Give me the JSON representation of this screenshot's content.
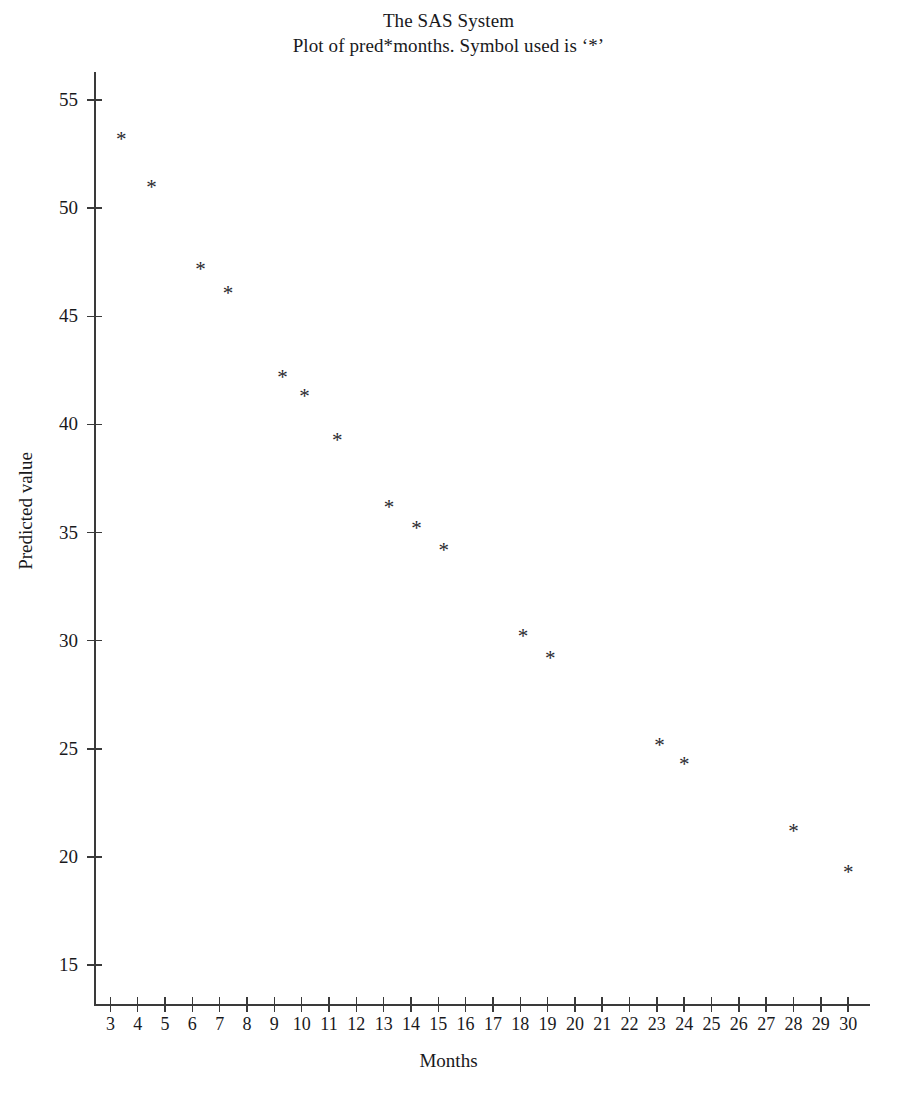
{
  "titles": {
    "line1": "The SAS System",
    "line2": "Plot of pred*months. Symbol used is ‘*’"
  },
  "axes": {
    "x_title": "Months",
    "y_title": "Predicted value"
  },
  "chart_data": {
    "type": "scatter",
    "title": "The SAS System",
    "subtitle": "Plot of pred*months. Symbol used is ‘*’",
    "xlabel": "Months",
    "ylabel": "Predicted value",
    "marker_symbol": "*",
    "marker_color": "#2a2a2e",
    "grid": false,
    "legend": "none",
    "xlim": [
      2.4,
      30.8
    ],
    "ylim": [
      13.2,
      56.3
    ],
    "x_ticks": [
      3,
      4,
      5,
      6,
      7,
      8,
      9,
      10,
      11,
      12,
      13,
      14,
      15,
      16,
      17,
      18,
      19,
      20,
      21,
      22,
      23,
      24,
      25,
      26,
      27,
      28,
      29,
      30
    ],
    "x_tick_labels": [
      "3",
      "4",
      "5",
      "6",
      "7",
      "8",
      "9",
      "10",
      "11",
      "12",
      "13",
      "14",
      "15",
      "16",
      "17",
      "18",
      "19",
      "20",
      "21",
      "22",
      "23",
      "24",
      "25",
      "26",
      "27",
      "28",
      "29",
      "30"
    ],
    "y_ticks": [
      15,
      20,
      25,
      30,
      35,
      40,
      45,
      50,
      55
    ],
    "y_tick_labels": [
      "15",
      "20",
      "25",
      "30",
      "35",
      "40",
      "45",
      "50",
      "55"
    ],
    "series": [
      {
        "name": "pred",
        "x": [
          3.4,
          4.5,
          6.3,
          7.3,
          9.3,
          10.1,
          11.3,
          13.2,
          14.2,
          15.2,
          18.1,
          19.1,
          23.1,
          24.0,
          28.0,
          30.0
        ],
        "y": [
          53.2,
          51.0,
          47.2,
          46.1,
          42.2,
          41.3,
          39.3,
          36.2,
          35.2,
          34.2,
          30.2,
          29.2,
          25.2,
          24.3,
          21.2,
          19.3
        ]
      }
    ]
  }
}
